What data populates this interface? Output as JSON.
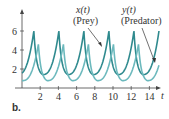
{
  "panel_label": "b.",
  "chart_data": {
    "type": "line",
    "title": "",
    "xlabel": "t",
    "ylabel": "",
    "xlim": [
      0,
      15.3
    ],
    "ylim": [
      0,
      7
    ],
    "x_ticks": [
      2,
      4,
      6,
      8,
      10,
      12,
      14
    ],
    "y_ticks": [
      2,
      4,
      6
    ],
    "grid": false,
    "series": [
      {
        "name": "x(t) (Prey)",
        "color": "#2f8a8e",
        "period": 2.75,
        "max": 6.0,
        "min": 1.2,
        "peaks_t": [
          1.3,
          4.1,
          6.85,
          9.6,
          12.3
        ],
        "annotation": "x(t)\n(Prey)"
      },
      {
        "name": "y(t) (Predator)",
        "color": "#6cb9bd",
        "period": 2.75,
        "max": 4.6,
        "min": 0.6,
        "peaks_t": [
          1.8,
          4.55,
          7.3,
          10.05,
          12.8
        ],
        "annotation": "y(t)\n(Predator)"
      }
    ],
    "annotations": [
      {
        "text_line1": "x(t)",
        "text_line2": "(Prey)",
        "points_to_series": "x(t) (Prey)"
      },
      {
        "text_line1": "y(t)",
        "text_line2": "(Predator)",
        "points_to_series": "y(t) (Predator)"
      }
    ]
  }
}
